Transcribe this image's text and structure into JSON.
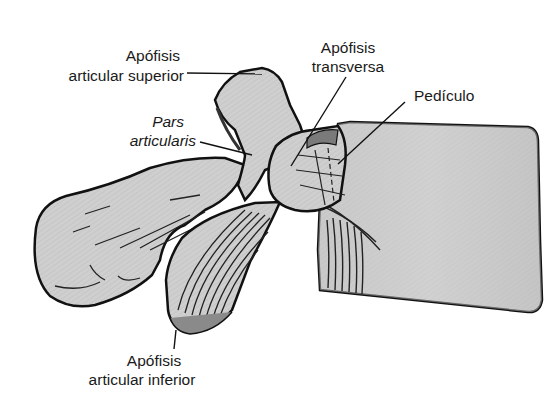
{
  "diagram": {
    "labels": {
      "sup": {
        "line1": "Apófisis",
        "line2": "articular superior"
      },
      "transv": {
        "line1": "Apófisis",
        "line2": "transversa"
      },
      "pedic": {
        "line1": "Pedículo"
      },
      "pars": {
        "line1": "Pars",
        "line2": "articularis"
      },
      "inf": {
        "line1": "Apófisis",
        "line2": "articular inferior"
      }
    },
    "colors": {
      "bone_fill": "#c9c9c9",
      "bone_light": "#dcdcdc",
      "outline": "#111111",
      "text": "#1a1a1a",
      "background": "#ffffff"
    }
  }
}
